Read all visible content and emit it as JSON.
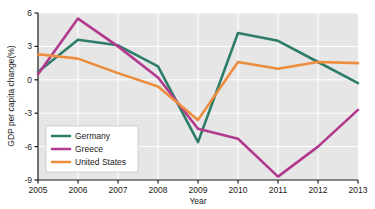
{
  "chart_data": {
    "type": "line",
    "title": "",
    "xlabel": "Year",
    "ylabel": "GDP per capita change(%)",
    "x": [
      2005,
      2006,
      2007,
      2008,
      2009,
      2010,
      2011,
      2012,
      2013
    ],
    "xticklabels": [
      "2005",
      "2006",
      "2007",
      "2008",
      "2009",
      "2010",
      "2011",
      "2012",
      "2013"
    ],
    "yticklabels": [
      "6",
      "3",
      "0",
      "-3",
      "-6",
      "-9"
    ],
    "yticks": [
      6,
      3,
      0,
      -3,
      -6,
      -9
    ],
    "xlim": [
      2005,
      2013
    ],
    "ylim": [
      -9,
      6
    ],
    "grid": true,
    "legend_position": "lower-left-inside",
    "plot_background": "#e6e6e6",
    "gridline_color": "#ffffff",
    "series": [
      {
        "name": "Germany",
        "color": "#2e7d6a",
        "values": [
          0.7,
          3.6,
          3.1,
          1.2,
          -5.6,
          4.2,
          3.5,
          1.6,
          -0.3
        ]
      },
      {
        "name": "Greece",
        "color": "#b13a8e",
        "values": [
          0.5,
          5.5,
          3.0,
          0.2,
          -4.4,
          -5.3,
          -8.7,
          -6.0,
          -2.7
        ]
      },
      {
        "name": "United States",
        "color": "#ed8c3c",
        "values": [
          2.3,
          1.9,
          0.6,
          -0.6,
          -3.6,
          1.6,
          1.0,
          1.6,
          1.5
        ]
      }
    ]
  },
  "legend": {
    "items": [
      {
        "label": "Germany",
        "color": "#2e7d6a"
      },
      {
        "label": "Greece",
        "color": "#b13a8e"
      },
      {
        "label": "United States",
        "color": "#ed8c3c"
      }
    ]
  }
}
